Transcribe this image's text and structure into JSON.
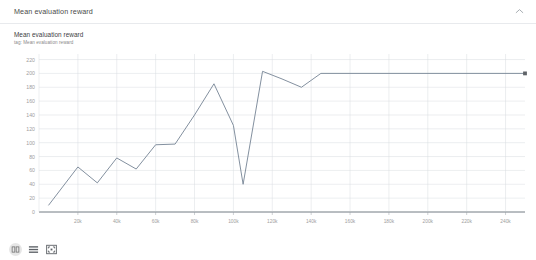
{
  "header": {
    "title": "Mean evaluation reward",
    "collapse_icon": "chevron-up-icon"
  },
  "chart": {
    "title": "Mean evaluation reward",
    "subtitle": "tag: Mean evaluation reward"
  },
  "controls": [
    {
      "name": "fit-domain-icon",
      "label": "Fit domain to data"
    },
    {
      "name": "data-table-icon",
      "label": "Toggle data table"
    },
    {
      "name": "fullscreen-icon",
      "label": "Expand chart"
    }
  ],
  "colors": {
    "line": "#7c8a9a",
    "grid": "#d8dce0",
    "axis": "#9aa0a6",
    "tick_text": "#9e9e9e",
    "card_border": "#e8eaed",
    "marker": "#5f6368"
  },
  "chart_data": {
    "type": "line",
    "title": "Mean evaluation reward",
    "subtitle": "tag: Mean evaluation reward",
    "xlabel": "",
    "ylabel": "",
    "xlim": [
      0,
      250000
    ],
    "ylim": [
      0,
      228
    ],
    "grid": true,
    "legend": false,
    "yticks": [
      0,
      20,
      40,
      60,
      80,
      100,
      120,
      140,
      160,
      180,
      200,
      220
    ],
    "ytick_labels": [
      "0",
      "20",
      "40",
      "60",
      "80",
      "100",
      "120",
      "140",
      "160",
      "180",
      "200",
      "220"
    ],
    "xticks": [
      20000,
      40000,
      60000,
      80000,
      100000,
      120000,
      140000,
      160000,
      180000,
      200000,
      220000,
      240000
    ],
    "xtick_labels": [
      "20k",
      "40k",
      "60k",
      "80k",
      "100k",
      "120k",
      "140k",
      "160k",
      "180k",
      "200k",
      "220k",
      "240k"
    ],
    "series": [
      {
        "name": "Mean evaluation reward",
        "color": "#7c8a9a",
        "end_marker": true,
        "x": [
          5000,
          20000,
          30000,
          40000,
          50000,
          60000,
          70000,
          80000,
          90000,
          100000,
          105000,
          115000,
          125000,
          135000,
          145000,
          250000
        ],
        "y": [
          10,
          65,
          42,
          78,
          62,
          97,
          98,
          140,
          185,
          125,
          40,
          203,
          192,
          180,
          200,
          200
        ]
      }
    ]
  }
}
